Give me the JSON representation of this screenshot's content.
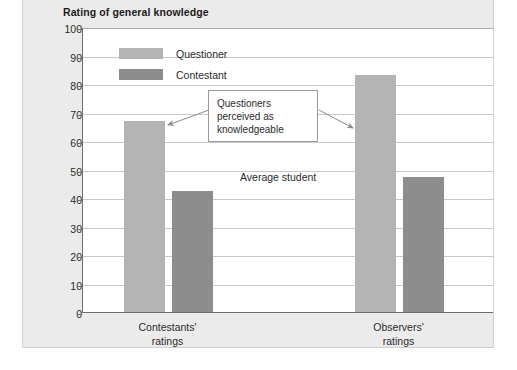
{
  "chart_data": {
    "type": "bar",
    "title": "Rating of general knowledge",
    "xlabel": "",
    "ylabel": "",
    "ylim": [
      0,
      100
    ],
    "ytick_step": 10,
    "yticks": [
      100,
      90,
      80,
      70,
      60,
      50,
      40,
      30,
      20,
      10,
      0
    ],
    "grid": true,
    "legend_position": "inside-top-left",
    "categories": [
      "Contestants' ratings",
      "Observers' ratings"
    ],
    "category_lines": [
      [
        "Contestants'",
        "ratings"
      ],
      [
        "Observers'",
        "ratings"
      ]
    ],
    "series": [
      {
        "name": "Questioner",
        "color": "#b4b4b4",
        "values": [
          67,
          83
        ]
      },
      {
        "name": "Contestant",
        "color": "#8d8d8d",
        "values": [
          42.5,
          47.5
        ]
      }
    ],
    "annotations": [
      {
        "id": "callout",
        "text_lines": [
          "Questioners",
          "perceived as",
          "knowledgeable"
        ],
        "arrows_point_to": [
          "Questioner @ Contestants' ratings",
          "Questioner @ Observers' ratings"
        ]
      },
      {
        "id": "average-student",
        "text": "Average student",
        "value": 50
      }
    ]
  },
  "legend": {
    "items": [
      {
        "label": "Questioner",
        "color": "#b4b4b4"
      },
      {
        "label": "Contestant",
        "color": "#8d8d8d"
      }
    ]
  },
  "colors": {
    "panel_background": "#ebebeb",
    "plot_background": "#ffffff",
    "axis": "#6e6e6e",
    "gridline": "#c9c9c9",
    "text": "#2b2b2b",
    "questioner": "#b4b4b4",
    "contestant": "#8d8d8d"
  }
}
